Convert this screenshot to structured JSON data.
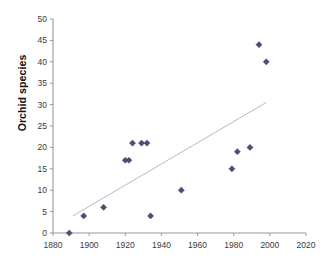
{
  "chart_data": {
    "type": "scatter",
    "title": "",
    "xlabel": "",
    "ylabel": "Orchid species",
    "xlim": [
      1880,
      2020
    ],
    "ylim": [
      0,
      50
    ],
    "xticks": [
      1880,
      1900,
      1920,
      1940,
      1960,
      1980,
      2000,
      2020
    ],
    "yticks": [
      0,
      5,
      10,
      15,
      20,
      25,
      30,
      35,
      40,
      45,
      50
    ],
    "xtick_step": 20,
    "ytick_step": 5,
    "grid": false,
    "legend": "none",
    "marker_color": "#4d4d77",
    "trendline_color": "#b9b9c4",
    "axis_color": "#9a9a9a",
    "points": [
      {
        "x": 1889,
        "y": 0
      },
      {
        "x": 1897,
        "y": 4
      },
      {
        "x": 1908,
        "y": 6
      },
      {
        "x": 1920,
        "y": 17
      },
      {
        "x": 1922,
        "y": 17
      },
      {
        "x": 1924,
        "y": 21
      },
      {
        "x": 1929,
        "y": 21
      },
      {
        "x": 1932,
        "y": 21
      },
      {
        "x": 1934,
        "y": 4
      },
      {
        "x": 1951,
        "y": 10
      },
      {
        "x": 1979,
        "y": 15
      },
      {
        "x": 1982,
        "y": 19
      },
      {
        "x": 1989,
        "y": 20
      },
      {
        "x": 1994,
        "y": 44
      },
      {
        "x": 1998,
        "y": 40
      }
    ],
    "trendline": {
      "x_start": 1891,
      "y_start": 4,
      "x_end": 1998,
      "y_end": 30.5
    }
  }
}
